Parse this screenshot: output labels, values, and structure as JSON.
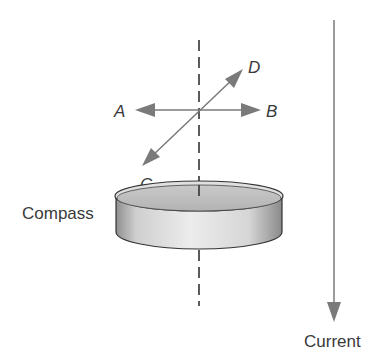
{
  "diagram": {
    "labels": {
      "a": "A",
      "b": "B",
      "c": "C",
      "d": "D",
      "compass": "Compass",
      "current": "Current"
    },
    "colors": {
      "arrow": "#7a7a7a",
      "dashed_line": "#333333",
      "compass_top": "#bdbdbd",
      "compass_side_light": "#e6e6e6",
      "compass_side_dark": "#8c8c8c",
      "text": "#3a3a3a"
    }
  }
}
